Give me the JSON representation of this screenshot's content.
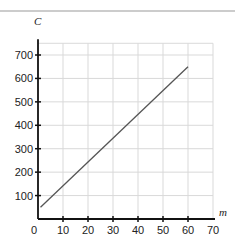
{
  "chart_data": {
    "type": "line",
    "title": "",
    "xlabel": "m",
    "ylabel": "C",
    "xlim": [
      0,
      70
    ],
    "ylim": [
      0,
      750
    ],
    "x_ticks": [
      0,
      10,
      20,
      30,
      40,
      50,
      60,
      70
    ],
    "y_ticks": [
      100,
      200,
      300,
      400,
      500,
      600,
      700
    ],
    "grid": true,
    "legend": null,
    "series": [
      {
        "name": "C",
        "x": [
          1,
          60
        ],
        "y": [
          50,
          650
        ],
        "color": "#555555"
      }
    ]
  },
  "labels": {
    "x_axis": "m",
    "y_axis": "C",
    "origin": "0"
  },
  "colors": {
    "axis": "#111111",
    "grid": "#d9d9d9",
    "line": "#555555",
    "top_rule": "#999999"
  }
}
